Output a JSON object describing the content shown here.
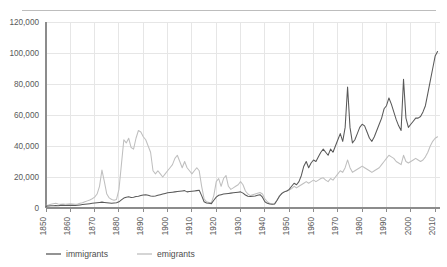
{
  "chart_data": {
    "type": "line",
    "title": "",
    "xlabel": "",
    "ylabel": "",
    "xlim": [
      1850,
      2012
    ],
    "ylim": [
      0,
      120000
    ],
    "grid": true,
    "legend_position": "bottom-left",
    "y_ticks": [
      0,
      20000,
      40000,
      60000,
      80000,
      100000,
      120000
    ],
    "y_tick_labels": [
      "0",
      "20,000",
      "40,000",
      "60,000",
      "80,000",
      "100,000",
      "120,000"
    ],
    "x_ticks": [
      1850,
      1860,
      1870,
      1880,
      1890,
      1900,
      1910,
      1920,
      1930,
      1940,
      1950,
      1960,
      1970,
      1980,
      1990,
      2000,
      2010
    ],
    "x_tick_labels": [
      "1850",
      "1860",
      "1870",
      "1880",
      "1890",
      "1900",
      "1910",
      "1920",
      "1930",
      "1940",
      "1950",
      "1960",
      "1970",
      "1980",
      "1990",
      "2000",
      "2010"
    ],
    "colors": {
      "immigrants": "#595959",
      "emigrants": "#bfbfbf",
      "gridline": "#e6e6e6",
      "axis": "#8c8c8c",
      "text": "#595959",
      "top_rule": "#bdbdbd"
    },
    "x": [
      1850,
      1851,
      1852,
      1853,
      1854,
      1855,
      1856,
      1857,
      1858,
      1859,
      1860,
      1861,
      1862,
      1863,
      1864,
      1865,
      1866,
      1867,
      1868,
      1869,
      1870,
      1871,
      1872,
      1873,
      1874,
      1875,
      1876,
      1877,
      1878,
      1879,
      1880,
      1881,
      1882,
      1883,
      1884,
      1885,
      1886,
      1887,
      1888,
      1889,
      1890,
      1891,
      1892,
      1893,
      1894,
      1895,
      1896,
      1897,
      1898,
      1899,
      1900,
      1901,
      1902,
      1903,
      1904,
      1905,
      1906,
      1907,
      1908,
      1909,
      1910,
      1911,
      1912,
      1913,
      1914,
      1915,
      1916,
      1917,
      1918,
      1919,
      1920,
      1921,
      1922,
      1923,
      1924,
      1925,
      1926,
      1927,
      1928,
      1929,
      1930,
      1931,
      1932,
      1933,
      1934,
      1935,
      1936,
      1937,
      1938,
      1939,
      1940,
      1941,
      1942,
      1943,
      1944,
      1945,
      1946,
      1947,
      1948,
      1949,
      1950,
      1951,
      1952,
      1953,
      1954,
      1955,
      1956,
      1957,
      1958,
      1959,
      1960,
      1961,
      1962,
      1963,
      1964,
      1965,
      1966,
      1967,
      1968,
      1969,
      1970,
      1971,
      1972,
      1973,
      1974,
      1975,
      1976,
      1977,
      1978,
      1979,
      1980,
      1981,
      1982,
      1983,
      1984,
      1985,
      1986,
      1987,
      1988,
      1989,
      1990,
      1991,
      1992,
      1993,
      1994,
      1995,
      1996,
      1997,
      1998,
      1999,
      2000,
      2001,
      2002,
      2003,
      2004,
      2005,
      2006,
      2007,
      2008,
      2009,
      2010,
      2011
    ],
    "series": [
      {
        "name": "immigrants",
        "values": [
          1200,
          1300,
          1400,
          1500,
          1600,
          1500,
          1700,
          1800,
          1600,
          1700,
          1800,
          1700,
          1600,
          1800,
          2000,
          2200,
          2400,
          2600,
          2800,
          3000,
          3200,
          3400,
          3600,
          3800,
          3600,
          3400,
          3200,
          3000,
          3200,
          3400,
          4000,
          5200,
          6400,
          7000,
          7200,
          6800,
          7000,
          7400,
          7600,
          8000,
          8400,
          8600,
          8200,
          7800,
          7600,
          7800,
          8200,
          8600,
          9000,
          9400,
          9800,
          10000,
          10200,
          10400,
          10600,
          10800,
          11000,
          11200,
          10400,
          10600,
          10800,
          11000,
          11200,
          11400,
          8000,
          4000,
          3200,
          3000,
          2800,
          5000,
          7000,
          8200,
          8600,
          9000,
          9200,
          9400,
          9600,
          9800,
          10000,
          10200,
          10400,
          9600,
          8400,
          7600,
          7400,
          7600,
          7800,
          8200,
          8600,
          7000,
          4000,
          3000,
          2600,
          2400,
          2600,
          5000,
          7600,
          9400,
          10400,
          11000,
          12000,
          14000,
          16000,
          15000,
          17000,
          21000,
          27000,
          30000,
          26000,
          29000,
          31000,
          30000,
          33000,
          36000,
          38000,
          36000,
          34000,
          38000,
          36000,
          40000,
          44000,
          48000,
          43000,
          52000,
          78000,
          52000,
          42000,
          44000,
          48000,
          52000,
          54000,
          53000,
          49000,
          45000,
          43000,
          46000,
          50000,
          54000,
          58000,
          64000,
          66000,
          71000,
          67000,
          62000,
          57000,
          53000,
          50000,
          83000,
          58000,
          52000,
          54000,
          56000,
          58000,
          58000,
          59000,
          62000,
          66000,
          74000,
          82000,
          90000,
          98000,
          101000
        ]
      },
      {
        "name": "emigrants",
        "values": [
          1800,
          2000,
          2400,
          2800,
          3000,
          2600,
          2400,
          2600,
          2400,
          2600,
          2800,
          2600,
          2400,
          2600,
          3000,
          3400,
          4000,
          4600,
          5200,
          6000,
          7000,
          9000,
          14000,
          24500,
          17000,
          9000,
          6500,
          5500,
          5000,
          5500,
          12000,
          28000,
          44000,
          42000,
          45000,
          39000,
          38000,
          45000,
          50000,
          49000,
          46000,
          44000,
          40000,
          36000,
          24000,
          22000,
          24000,
          22000,
          20000,
          22000,
          24000,
          26000,
          28000,
          32000,
          34000,
          30000,
          26000,
          30000,
          26000,
          24000,
          22000,
          24000,
          26000,
          24000,
          14000,
          6000,
          4000,
          3500,
          3500,
          8000,
          17000,
          19000,
          14000,
          19000,
          21000,
          14000,
          12000,
          13000,
          14000,
          15000,
          17000,
          15000,
          11000,
          9000,
          8000,
          8500,
          9000,
          9500,
          10000,
          9000,
          6000,
          4000,
          3000,
          2600,
          2800,
          5000,
          8000,
          9500,
          10500,
          11000,
          11500,
          12500,
          14000,
          13000,
          14000,
          15000,
          16000,
          17000,
          16000,
          17000,
          18000,
          17000,
          18000,
          19000,
          19500,
          18000,
          17000,
          19000,
          18000,
          20000,
          22000,
          24000,
          23000,
          26000,
          31000,
          26000,
          23000,
          24000,
          25000,
          26000,
          27000,
          26000,
          25000,
          24000,
          23000,
          24000,
          25000,
          26000,
          28000,
          30000,
          32000,
          34000,
          33000,
          32000,
          30000,
          29000,
          28000,
          34000,
          30000,
          29000,
          30000,
          31000,
          32000,
          31000,
          30000,
          31000,
          33000,
          36000,
          40000,
          43000,
          45000,
          46000
        ]
      }
    ]
  },
  "legend": {
    "items": [
      {
        "label": "immigrants",
        "color": "#595959"
      },
      {
        "label": "emigrants",
        "color": "#bfbfbf"
      }
    ]
  }
}
